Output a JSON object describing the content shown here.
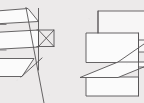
{
  "canvas": {
    "width": 144,
    "height": 103,
    "background_color": "#eceaea",
    "stroke_color": "#565355",
    "face_color": "#fbfbfb",
    "description": "Scanned technical line drawing of two wireframe box/plane intersection figures"
  },
  "figures": [
    {
      "id": "left-figure",
      "name": "left-wireframe-figure",
      "label": "",
      "parts": [
        {
          "name": "upper-slab-face",
          "type": "quad",
          "points": "-14,12 28,9 38,22 -14,25"
        },
        {
          "name": "mid-slab-face",
          "type": "quad",
          "points": "-14,33 38,30 38,47 -14,50"
        },
        {
          "name": "lower-slab-face",
          "type": "quad",
          "points": "-14,58 33,58 22,76 -14,76"
        },
        {
          "name": "vertical-box-right-edge",
          "type": "line",
          "points": "38,9 38,68"
        },
        {
          "name": "diagonal-long-edge",
          "type": "line",
          "points": "26,8 44,103"
        },
        {
          "name": "bowtie-upper-triangle",
          "type": "polyline",
          "points": "36,30 54,30 40,46"
        },
        {
          "name": "bowtie-lower-triangle",
          "type": "polyline",
          "points": "36,46 54,46 40,30"
        },
        {
          "name": "bowtie-right-edge",
          "type": "line",
          "points": "54,30 54,46"
        },
        {
          "name": "lower-diagonal-ray",
          "type": "line",
          "points": "22,76 42,58"
        }
      ]
    },
    {
      "id": "right-figure",
      "name": "right-wireframe-figure",
      "label": "",
      "parts": [
        {
          "name": "back-upper-rectangle",
          "type": "rect",
          "points": "98,11 160,11 160,52 98,52"
        },
        {
          "name": "front-main-rectangle",
          "type": "rect",
          "points": "86,33 138,33 138,62 86,62"
        },
        {
          "name": "horizontal-plane-parallelogram",
          "type": "quad",
          "points": "80,77 118,62 152,62 114,77"
        },
        {
          "name": "bottom-rectangle",
          "type": "rect",
          "points": "86,77 138,77 138,96 86,96"
        },
        {
          "name": "right-side-edge",
          "type": "line",
          "points": "138,33 138,96"
        },
        {
          "name": "right-stub-upper",
          "type": "line",
          "points": "138,40 160,40"
        },
        {
          "name": "right-stub-lower",
          "type": "line",
          "points": "138,66 160,66"
        },
        {
          "name": "plane-diagonal",
          "type": "line",
          "points": "118,62 144,44"
        }
      ]
    }
  ]
}
